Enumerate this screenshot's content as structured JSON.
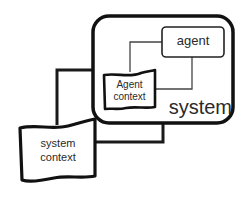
{
  "diagram": {
    "nodes": {
      "system": {
        "label": "system"
      },
      "agent": {
        "label": "agent"
      },
      "agent_context": {
        "line1": "Agent",
        "line2": "context"
      },
      "system_context": {
        "line1": "system",
        "line2": "context"
      }
    },
    "edges": [
      {
        "from": "agent",
        "to": "agent_context",
        "style": "thin"
      },
      {
        "from": "agent",
        "to": "agent_context",
        "style": "thin"
      },
      {
        "from": "system",
        "to": "system_context",
        "style": "thick"
      },
      {
        "from": "system",
        "to": "system_context",
        "style": "thick"
      }
    ],
    "colors": {
      "stroke": "#1a1a1a",
      "thin_stroke": "#444444",
      "background": "#ffffff",
      "text": "#2a2a2a"
    }
  }
}
